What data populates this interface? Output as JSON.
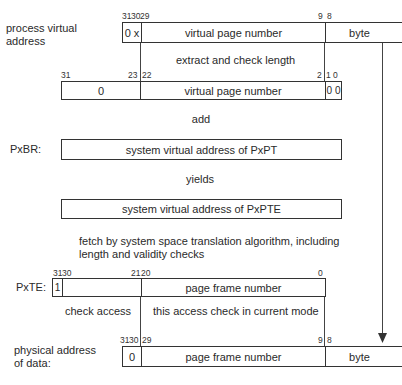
{
  "process_va": {
    "label_line1": "process virtual",
    "label_line2": "address",
    "bits": {
      "b31": "31",
      "b30": "30",
      "b29": "29",
      "b9": "9",
      "b8": "8"
    },
    "fields": {
      "top": "0 x",
      "vpn": "virtual page number",
      "byte": "byte"
    }
  },
  "step1": "extract and check length",
  "shifted": {
    "bits": {
      "b31": "31",
      "b23": "23",
      "b22": "22",
      "b2": "2",
      "b1": "1",
      "b0": "0"
    },
    "fields": {
      "zero": "0",
      "vpn": "virtual page number",
      "low": "0 0"
    }
  },
  "step2": "add",
  "pxbr": {
    "label": "PxBR:",
    "field": "system virtual address of PxPT"
  },
  "step3": "yields",
  "pxpte": {
    "field": "system virtual address of PxPTE"
  },
  "step4": {
    "line1": "fetch by system space translation algorithm, including",
    "line2": "length and validity checks"
  },
  "pxte": {
    "label": "PxTE:",
    "bits": {
      "b31": "31",
      "b30": "30",
      "b21": "21",
      "b20": "20",
      "b0": "0"
    },
    "fields": {
      "valid": "1",
      "pfn": "page frame number"
    }
  },
  "check_access": "check access",
  "check_mode": "this access check in current mode",
  "physical": {
    "label_line1": "physical address",
    "label_line2": "of data:",
    "bits": {
      "b31": "31",
      "b30": "30",
      "b29": "29",
      "b9": "9",
      "b8": "8"
    },
    "fields": {
      "zero": "0",
      "pfn": "page frame number",
      "byte": "byte"
    }
  }
}
